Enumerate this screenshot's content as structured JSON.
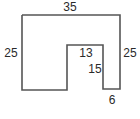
{
  "diagram": {
    "type": "polygon-with-dimensions",
    "stroke_color": "#555555",
    "label_color": "#2a2a2a",
    "shape_points": [
      [
        22,
        15
      ],
      [
        120,
        15
      ],
      [
        120,
        89
      ],
      [
        103,
        89
      ],
      [
        103,
        45
      ],
      [
        67,
        45
      ],
      [
        67,
        90
      ],
      [
        22,
        90
      ]
    ],
    "labels": {
      "top": "35",
      "left": "25",
      "right": "25",
      "inner_top": "13",
      "inner_side": "15",
      "bottom_leg": "6"
    }
  }
}
